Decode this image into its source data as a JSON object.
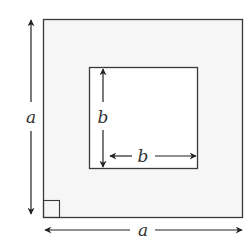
{
  "diagram": {
    "outer_square": {
      "label": "a",
      "fill": "#f7f7f7",
      "stroke": "#333333"
    },
    "inner_square": {
      "label": "b",
      "fill": "#ffffff",
      "stroke": "#333333"
    },
    "labels": {
      "outer_vertical": "a",
      "outer_horizontal": "a",
      "inner_vertical": "b",
      "inner_horizontal": "b"
    },
    "right_angle_marker": true
  }
}
